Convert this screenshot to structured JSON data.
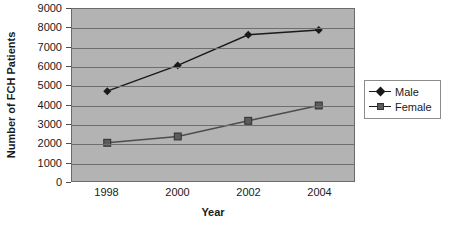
{
  "chart_data": {
    "type": "line",
    "title": "",
    "xlabel": "Year",
    "ylabel": "Number of FCH Patients",
    "categories": [
      "1998",
      "2000",
      "2002",
      "2004"
    ],
    "x": [
      1998,
      2000,
      2002,
      2004
    ],
    "series": [
      {
        "name": "Male",
        "values": [
          4700,
          6050,
          7650,
          7900
        ],
        "marker": "diamond",
        "color": "#1a1a1a"
      },
      {
        "name": "Female",
        "values": [
          2000,
          2330,
          3150,
          3950
        ],
        "marker": "square",
        "color": "#4d4d4d"
      }
    ],
    "ylim": [
      0,
      9000
    ],
    "yticks": [
      0,
      1000,
      2000,
      3000,
      4000,
      5000,
      6000,
      7000,
      8000,
      9000
    ],
    "ytick_labels": [
      "0",
      "1000",
      "2000",
      "3000",
      "4000",
      "5000",
      "6000",
      "7000",
      "8000",
      "9000"
    ],
    "grid": "horizontal",
    "legend_position": "right",
    "plot_background": "#b3b3b3",
    "figure_background": "#ffffff"
  },
  "legend": {
    "entries": [
      {
        "label": "Male",
        "marker": "diamond-marker"
      },
      {
        "label": "Female",
        "marker": "square-marker"
      }
    ]
  }
}
